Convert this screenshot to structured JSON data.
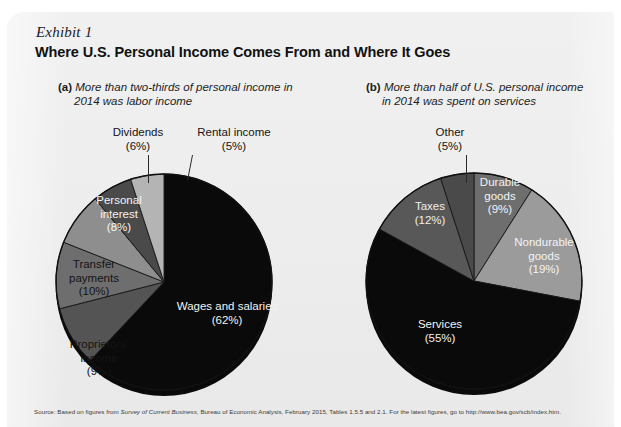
{
  "exhibit": {
    "label": "Exhibit 1",
    "title": "Where U.S. Personal Income Comes From and Where It Goes"
  },
  "captions": {
    "a_tag": "(a)",
    "a_line1": "More than two-thirds of personal income in",
    "a_line2": "2014 was labor income",
    "b_tag": "(b)",
    "b_line1": "More than half of U.S. personal income",
    "b_line2": "in 2014 was spent on services"
  },
  "source": {
    "prefix": "Source: Based on figures from ",
    "italic": "Survey of Current Business",
    "suffix": ", Bureau of Economic Analysis, February 2015, Tables 1.5.5 and 2.1. For the latest figures, go to http://www.bea.gov/scb/index.htm."
  },
  "labels": {
    "a": {
      "wages": "Wages and salaries\n(62%)",
      "proprietors": "Proprietors'\nincome\n(9%)",
      "transfer": "Transfer\npayments\n(10%)",
      "interest": "Personal\ninterest\n(8%)",
      "dividends": "Dividends\n(6%)",
      "rental": "Rental income\n(5%)"
    },
    "b": {
      "services": "Services\n(55%)",
      "taxes": "Taxes\n(12%)",
      "other": "Other\n(5%)",
      "durable": "Durable\ngoods\n(9%)",
      "nondurable": "Nondurable\ngoods\n(19%)"
    }
  },
  "chart_data": [
    {
      "type": "pie",
      "id": "income-sources",
      "title": "More than two-thirds of personal income in 2014 was labor income",
      "panel": "(a)",
      "units": "percent of U.S. personal income",
      "start_angle_deg": 0,
      "direction": "clockwise",
      "total": 100,
      "categories": [
        "Wages and salaries",
        "Proprietors' income",
        "Transfer payments",
        "Personal interest",
        "Dividends",
        "Rental income"
      ],
      "values": [
        62,
        9,
        10,
        8,
        6,
        5
      ],
      "colors": [
        "#0a0a0a",
        "#545454",
        "#6e6e6e",
        "#8e8e8e",
        "#4a4a4a",
        "#b4b4b4"
      ],
      "legend": "none",
      "labels_inline": true
    },
    {
      "type": "pie",
      "id": "income-uses",
      "title": "More than half of U.S. personal income in 2014 was spent on services",
      "panel": "(b)",
      "units": "percent of U.S. personal income",
      "start_angle_deg": 0,
      "direction": "clockwise",
      "total": 100,
      "categories": [
        "Durable goods",
        "Nondurable goods",
        "Services",
        "Taxes",
        "Other"
      ],
      "values": [
        9,
        19,
        55,
        12,
        5
      ],
      "colors": [
        "#6e6e6e",
        "#9b9b9b",
        "#0a0a0a",
        "#585858",
        "#4a4a4a"
      ],
      "legend": "none",
      "labels_inline": true
    }
  ],
  "colors": {
    "panel_bg": "#eeeeee",
    "page_bg": "#ffffff",
    "ink": "#111111",
    "slice_dark": "#0a0a0a",
    "slice_light": "#b4b4b4"
  }
}
